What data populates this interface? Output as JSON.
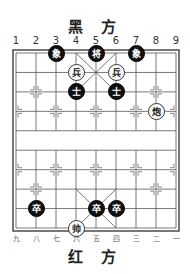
{
  "header": {
    "top_side": "黑 方",
    "bottom_side": "红 方"
  },
  "files_top": [
    "1",
    "2",
    "3",
    "4",
    "5",
    "6",
    "7",
    "8",
    "9"
  ],
  "files_bottom": [
    "九",
    "八",
    "七",
    "六",
    "五",
    "四",
    "三",
    "二",
    "一"
  ],
  "colors": {
    "black_piece": "#111111",
    "red_piece_bg": "#ffffff",
    "lines": "#555555"
  },
  "pieces": [
    {
      "side": "black",
      "char": "象",
      "file": 3,
      "rank": 0
    },
    {
      "side": "black",
      "char": "将",
      "file": 5,
      "rank": 0
    },
    {
      "side": "black",
      "char": "象",
      "file": 7,
      "rank": 0
    },
    {
      "side": "red",
      "char": "兵",
      "file": 4,
      "rank": 1
    },
    {
      "side": "red",
      "char": "兵",
      "file": 6,
      "rank": 1
    },
    {
      "side": "black",
      "char": "士",
      "file": 4,
      "rank": 2
    },
    {
      "side": "black",
      "char": "士",
      "file": 6,
      "rank": 2
    },
    {
      "side": "red",
      "char": "炮",
      "file": 8,
      "rank": 3
    },
    {
      "side": "black",
      "char": "卒",
      "file": 2,
      "rank": 8
    },
    {
      "side": "black",
      "char": "卒",
      "file": 5,
      "rank": 8
    },
    {
      "side": "black",
      "char": "卒",
      "file": 6,
      "rank": 8
    },
    {
      "side": "red",
      "char": "帅",
      "file": 4,
      "rank": 9
    }
  ]
}
